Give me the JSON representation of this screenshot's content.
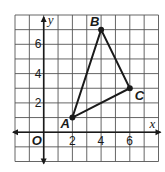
{
  "diagram": {
    "type": "coordinate-plane-triangle",
    "axes": {
      "x_label": "x",
      "y_label": "y",
      "origin_label": "O"
    },
    "grid": {
      "x_min": -2,
      "x_max": 8,
      "y_min": -2,
      "y_max": 8,
      "step": 1
    },
    "x_ticks": [
      {
        "value": 2,
        "label": "2"
      },
      {
        "value": 4,
        "label": "4"
      },
      {
        "value": 6,
        "label": "6"
      }
    ],
    "y_ticks": [
      {
        "value": 2,
        "label": "2"
      },
      {
        "value": 4,
        "label": "4"
      },
      {
        "value": 6,
        "label": "6"
      }
    ],
    "points": [
      {
        "name": "A",
        "x": 2,
        "y": 1
      },
      {
        "name": "B",
        "x": 4,
        "y": 7
      },
      {
        "name": "C",
        "x": 6,
        "y": 3
      }
    ],
    "colors": {
      "grid": "#555555",
      "line": "#1a1a1a"
    }
  }
}
